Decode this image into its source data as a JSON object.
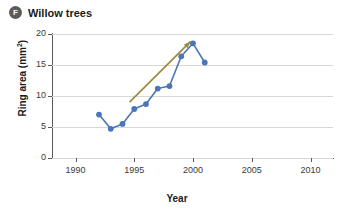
{
  "panel": {
    "badge": "F",
    "title": "Willow trees"
  },
  "chart_data": {
    "type": "line",
    "title": "Willow trees",
    "xlabel": "Year",
    "ylabel": "Ring area (mm²)",
    "xlim": [
      1988,
      2012
    ],
    "ylim": [
      0,
      20
    ],
    "grid": true,
    "legend": "none",
    "xticks": [
      1990,
      1995,
      2000,
      2005,
      2010
    ],
    "yticks": [
      0,
      5,
      10,
      15,
      20
    ],
    "series": [
      {
        "name": "Willow ring area",
        "color": "#4a76b8",
        "x": [
          1992,
          1993,
          1994,
          1995,
          1996,
          1997,
          1998,
          1999,
          2000,
          2001
        ],
        "values": [
          7.0,
          4.7,
          5.5,
          7.9,
          8.7,
          11.2,
          11.6,
          16.4,
          18.5,
          15.4
        ]
      }
    ],
    "annotations": [
      {
        "type": "arrow",
        "label": "increasing-trend-arrow",
        "color": "#9a8b3e",
        "from": [
          1994.6,
          9.0
        ],
        "to": [
          1999.8,
          18.8
        ]
      }
    ]
  },
  "colors": {
    "line": "#4a76b8",
    "marker": "#4a76b8",
    "arrow": "#9a8b3e",
    "grid": "#d8d8d8",
    "axis": "#5a5a5a",
    "badge": "#5b5b5b",
    "text": "#1b1b1b"
  }
}
